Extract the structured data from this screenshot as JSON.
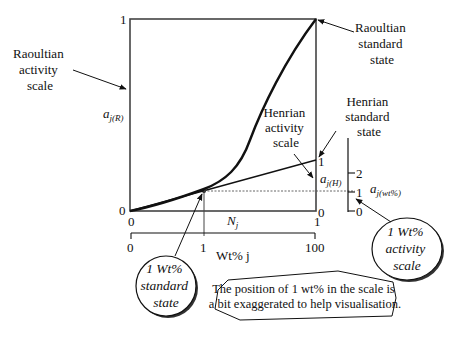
{
  "diagram": {
    "raoultian_scale": {
      "label_lines": [
        "Raoultian",
        "activity",
        "scale"
      ],
      "axis_symbol": "a",
      "axis_subscript": "j(R)",
      "tick_top": "1",
      "tick_bottom": "0"
    },
    "raoultian_standard_state": {
      "label_lines": [
        "Raoultian",
        "standard",
        "state"
      ]
    },
    "henrian_standard_state": {
      "label_lines": [
        "Henrian",
        "standard",
        "state"
      ]
    },
    "henrian_activity_scale": {
      "label_lines": [
        "Henrian",
        "activity",
        "scale"
      ],
      "axis_symbol": "a",
      "axis_subscript": "j(H)",
      "tick_top": "1",
      "tick_bottom": "0"
    },
    "wt_activity_scale": {
      "axis_symbol": "a",
      "axis_subscript": "j(wt%)",
      "ticks": [
        "2",
        "1",
        "0"
      ]
    },
    "mole_fraction_axis": {
      "symbol": "N",
      "subscript": "j",
      "tick_left": "0",
      "tick_right": "1"
    },
    "wt_axis": {
      "label": "Wt% j",
      "ticks": [
        "0",
        "1",
        "100"
      ]
    },
    "bubbles": {
      "standard_state": [
        "1 Wt%",
        "standard",
        "state"
      ],
      "activity_scale": [
        "1 Wt%",
        "activity",
        "scale"
      ]
    },
    "note": {
      "lines": [
        "The position of 1 wt% in the scale is",
        "a bit exaggerated to help visualisation."
      ]
    },
    "colors": {
      "line": "#111111",
      "dotted": "#555555",
      "bubble_shadow": "#333333"
    }
  }
}
